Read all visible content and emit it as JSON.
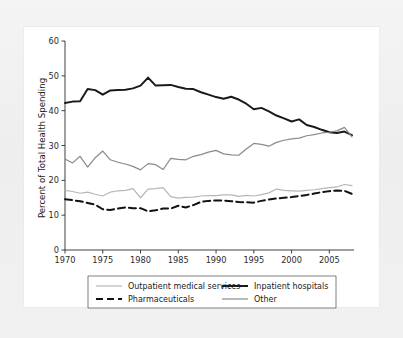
{
  "figure": {
    "background_paper": "#f1f1f2",
    "plate_background": "#ffffff"
  },
  "chart_data": {
    "type": "line",
    "title": "",
    "subtitle": "",
    "xlabel": "",
    "ylabel": "Percent of Total Health Spending",
    "xlim": [
      1970,
      2008
    ],
    "ylim": [
      0,
      60
    ],
    "yticks": [
      0,
      10,
      20,
      30,
      40,
      50,
      60
    ],
    "ytick_labels": [
      "0",
      "10",
      "20",
      "30",
      "40",
      "50",
      "60"
    ],
    "xticks": [
      1970,
      1975,
      1980,
      1985,
      1990,
      1995,
      2000,
      2005
    ],
    "xtick_labels": [
      "1970",
      "1975",
      "1980",
      "1985",
      "1990",
      "1995",
      "2000",
      "2005"
    ],
    "grid": false,
    "legend_position": "below-axes",
    "x": [
      1970,
      1971,
      1972,
      1973,
      1974,
      1975,
      1976,
      1977,
      1978,
      1979,
      1980,
      1981,
      1982,
      1983,
      1984,
      1985,
      1986,
      1987,
      1988,
      1989,
      1990,
      1991,
      1992,
      1993,
      1994,
      1995,
      1996,
      1997,
      1998,
      1999,
      2000,
      2001,
      2002,
      2003,
      2004,
      2005,
      2006,
      2007,
      2008
    ],
    "series": [
      {
        "name": "Inpatient hospitals",
        "color": "#1a1a1a",
        "width": 2.0,
        "dash": "none",
        "values": [
          42.2,
          42.6,
          42.7,
          46.2,
          45.9,
          44.6,
          45.8,
          45.9,
          46.0,
          46.4,
          47.2,
          49.5,
          47.2,
          47.3,
          47.4,
          46.8,
          46.3,
          46.2,
          45.3,
          44.6,
          43.9,
          43.4,
          44.0,
          43.2,
          42.0,
          40.4,
          40.8,
          39.8,
          38.6,
          37.8,
          36.9,
          37.5,
          35.9,
          35.3,
          34.5,
          33.8,
          33.6,
          34.0,
          33.0
        ]
      },
      {
        "name": "Other",
        "color": "#8a8a8a",
        "width": 1.2,
        "dash": "none",
        "values": [
          26.1,
          25.0,
          26.9,
          23.8,
          26.5,
          28.4,
          25.9,
          25.2,
          24.7,
          24.0,
          23.0,
          24.8,
          24.5,
          23.1,
          26.3,
          26.0,
          25.9,
          26.9,
          27.4,
          28.1,
          28.6,
          27.6,
          27.3,
          27.2,
          29.0,
          30.6,
          30.3,
          29.8,
          30.9,
          31.5,
          31.9,
          32.1,
          32.8,
          33.1,
          33.6,
          33.8,
          34.2,
          35.2,
          32.5
        ]
      },
      {
        "name": "Outpatient medical services",
        "color": "#b6b6b6",
        "width": 1.2,
        "dash": "none",
        "values": [
          17.1,
          16.8,
          16.3,
          16.6,
          16.0,
          15.5,
          16.6,
          17.0,
          17.1,
          17.6,
          15.0,
          17.5,
          17.6,
          17.9,
          15.3,
          14.9,
          15.1,
          15.2,
          15.5,
          15.6,
          15.6,
          15.8,
          15.8,
          15.4,
          15.7,
          15.5,
          15.9,
          16.4,
          17.5,
          17.1,
          17.0,
          16.9,
          17.1,
          17.3,
          17.6,
          17.9,
          18.1,
          18.8,
          18.5
        ]
      },
      {
        "name": "Pharmaceuticals",
        "color": "#111111",
        "width": 2.0,
        "dash": "7,4",
        "values": [
          14.6,
          14.3,
          14.0,
          13.5,
          13.0,
          11.7,
          11.5,
          11.9,
          12.2,
          12.0,
          12.0,
          11.1,
          11.4,
          11.9,
          11.9,
          12.7,
          12.2,
          12.9,
          13.8,
          14.1,
          14.2,
          14.2,
          14.0,
          13.8,
          13.7,
          13.6,
          14.1,
          14.5,
          14.8,
          15.0,
          15.2,
          15.5,
          15.8,
          16.2,
          16.6,
          16.9,
          17.1,
          17.0,
          16.1
        ]
      }
    ],
    "legend": [
      {
        "label": "Outpatient medical services",
        "color": "#b6b6b6",
        "dash": "none",
        "width": 1.2,
        "col": 0,
        "row": 0
      },
      {
        "label": "Inpatient hospitals",
        "color": "#1a1a1a",
        "dash": "none",
        "width": 2.0,
        "col": 1,
        "row": 0
      },
      {
        "label": "Pharmaceuticals",
        "color": "#111111",
        "dash": "7,4",
        "width": 2.0,
        "col": 0,
        "row": 1
      },
      {
        "label": "Other",
        "color": "#8a8a8a",
        "dash": "none",
        "width": 1.2,
        "col": 1,
        "row": 1
      }
    ]
  }
}
